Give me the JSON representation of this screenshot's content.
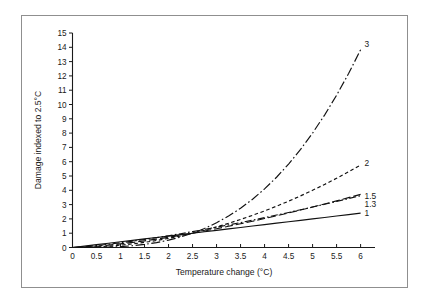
{
  "chart_data": {
    "type": "line",
    "title": "",
    "xlabel": "Temperature change (°C)",
    "ylabel": "Damage indexed to 2.5°C",
    "xlim": [
      0,
      6.3
    ],
    "ylim": [
      0,
      15
    ],
    "grid": false,
    "legend_position": "curve-end-labels",
    "xticks": [
      "0",
      "0.5",
      "1",
      "1.5",
      "2",
      "2.5",
      "3",
      "3.5",
      "4",
      "4.5",
      "5",
      "5.5",
      "6"
    ],
    "xtick_values": [
      0,
      0.5,
      1,
      1.5,
      2,
      2.5,
      3,
      3.5,
      4,
      4.5,
      5,
      5.5,
      6
    ],
    "yticks": [
      "0",
      "1",
      "2",
      "3",
      "4",
      "5",
      "6",
      "7",
      "8",
      "9",
      "10",
      "11",
      "12",
      "13",
      "14",
      "15"
    ],
    "ytick_values": [
      0,
      1,
      2,
      3,
      4,
      5,
      6,
      7,
      8,
      9,
      10,
      11,
      12,
      13,
      14,
      15
    ],
    "reference_point": {
      "x": 2.5,
      "y": 1
    },
    "x": [
      0,
      0.25,
      0.5,
      0.75,
      1,
      1.25,
      1.5,
      1.75,
      2,
      2.25,
      2.5,
      2.75,
      3,
      3.25,
      3.5,
      3.75,
      4,
      4.25,
      4.5,
      4.75,
      5,
      5.25,
      5.5,
      5.75,
      6
    ],
    "series": [
      {
        "name": "1",
        "exponent": 1,
        "label": "1",
        "dash": "solid",
        "label_y": 2.4,
        "values": [
          0,
          0.1,
          0.2,
          0.3,
          0.4,
          0.5,
          0.6,
          0.7,
          0.8,
          0.9,
          1.0,
          1.1,
          1.2,
          1.3,
          1.4,
          1.5,
          1.6,
          1.7,
          1.8,
          1.9,
          2.0,
          2.1,
          2.2,
          2.3,
          2.4
        ]
      },
      {
        "name": "1.3",
        "exponent": 1.3,
        "label": "1.3",
        "dash": "dash-dot",
        "label_y": 3.05,
        "values": [
          0,
          0.054,
          0.133,
          0.226,
          0.33,
          0.443,
          0.563,
          0.69,
          0.824,
          0.964,
          1.11,
          1.26,
          1.42,
          1.58,
          1.74,
          1.91,
          2.09,
          2.27,
          2.45,
          2.64,
          2.83,
          3.02,
          3.22,
          3.42,
          3.62
        ]
      },
      {
        "name": "1.5",
        "exponent": 1.5,
        "label": "1.5",
        "dash": "long-dash",
        "label_y": 3.6,
        "values": [
          0,
          0.032,
          0.089,
          0.164,
          0.253,
          0.354,
          0.465,
          0.586,
          0.715,
          0.854,
          1.0,
          1.154,
          1.315,
          1.482,
          1.657,
          1.837,
          2.024,
          2.217,
          2.415,
          2.62,
          2.828,
          3.043,
          3.262,
          3.486,
          3.715
        ]
      },
      {
        "name": "2",
        "exponent": 2,
        "label": "2",
        "dash": "short-dash",
        "label_y": 5.9,
        "values": [
          0,
          0.01,
          0.04,
          0.09,
          0.16,
          0.25,
          0.36,
          0.49,
          0.64,
          0.81,
          1.0,
          1.21,
          1.44,
          1.69,
          1.96,
          2.25,
          2.56,
          2.89,
          3.24,
          3.61,
          4.0,
          4.41,
          4.84,
          5.29,
          5.76
        ]
      },
      {
        "name": "3",
        "exponent": 3,
        "label": "3",
        "dash": "dash-dot-long",
        "label_y": 14.2,
        "values": [
          0,
          0.001,
          0.008,
          0.027,
          0.064,
          0.125,
          0.216,
          0.343,
          0.512,
          0.729,
          1.0,
          1.331,
          1.728,
          2.197,
          2.744,
          3.375,
          4.096,
          4.913,
          5.832,
          6.859,
          8.0,
          9.261,
          10.648,
          12.167,
          13.824
        ]
      }
    ]
  },
  "colors": {
    "curve": "#111111",
    "axis": "#1a1a1a",
    "frame": "#8f8f8f",
    "background": "#ffffff"
  }
}
